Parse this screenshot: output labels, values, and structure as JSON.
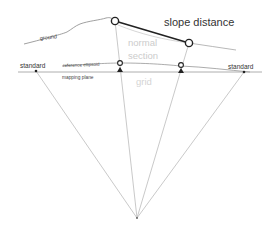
{
  "diagram": {
    "title": "slope distance",
    "labels": {
      "slope_distance": "slope distance",
      "ground": "ground",
      "normal": "normal",
      "section": "section",
      "grid": "grid",
      "standard_left": "standard",
      "standard_right": "standard",
      "reference_ellipsoid": "reference ellipsoid",
      "mapping_plane": "mapping plane"
    },
    "colors": {
      "line_dark": "#222222",
      "line_mid": "#777777",
      "line_light": "#bbbbbb",
      "text_dark": "#333333",
      "text_light": "#cccccc",
      "background": "#ffffff"
    },
    "points": {
      "ground_left_station": [
        115,
        21
      ],
      "ground_right_station": [
        189,
        43
      ],
      "ellipsoid_left_station": [
        120,
        63
      ],
      "ellipsoid_right_station": [
        181,
        66
      ],
      "standard_left_point": [
        36,
        71
      ],
      "standard_right_point": [
        244,
        72
      ],
      "earth_center": [
        137,
        218
      ]
    }
  }
}
